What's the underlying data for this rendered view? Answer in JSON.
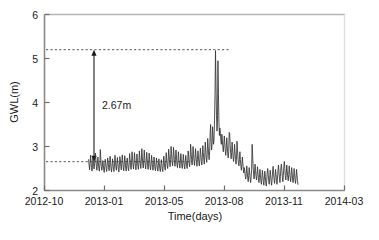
{
  "chart_data": {
    "type": "line",
    "title": "",
    "xlabel": "Time(days)",
    "ylabel": "GWL(m)",
    "ylim": [
      2,
      6
    ],
    "yticks": [
      2,
      3,
      4,
      5,
      6
    ],
    "ytick_labels": [
      "2",
      "3",
      "4",
      "5",
      "6"
    ],
    "xtick_labels": [
      "2012-10",
      "2013-01",
      "2013-05",
      "2013-08",
      "2013-11",
      "2014-03"
    ],
    "xtick_positions": [
      0,
      0.2,
      0.4,
      0.6,
      0.8,
      1.0
    ],
    "grid": false,
    "legend": "none",
    "line_color": "#333333",
    "series": [
      {
        "name": "GWL",
        "x_start_frac": 0.147,
        "x_end_frac": 0.845,
        "values": [
          2.7,
          2.58,
          2.47,
          2.62,
          2.8,
          2.66,
          2.52,
          2.44,
          2.57,
          2.74,
          2.62,
          2.49,
          2.55,
          2.71,
          2.85,
          2.7,
          2.54,
          2.46,
          2.6,
          2.76,
          2.63,
          2.5,
          2.44,
          2.58,
          2.93,
          2.72,
          2.55,
          2.46,
          2.52,
          2.68,
          2.6,
          2.47,
          2.41,
          2.55,
          2.71,
          2.63,
          2.5,
          2.43,
          2.57,
          2.74,
          2.66,
          2.52,
          2.45,
          2.59,
          2.78,
          2.64,
          2.49,
          2.42,
          2.55,
          2.72,
          2.61,
          2.48,
          2.43,
          2.58,
          2.8,
          2.67,
          2.53,
          2.46,
          2.6,
          2.75,
          2.62,
          2.48,
          2.42,
          2.56,
          2.77,
          2.7,
          2.55,
          2.47,
          2.62,
          2.81,
          2.68,
          2.53,
          2.45,
          2.59,
          2.79,
          2.66,
          2.51,
          2.44,
          2.57,
          2.74,
          2.63,
          2.5,
          2.45,
          2.6,
          2.84,
          2.71,
          2.56,
          2.48,
          2.63,
          2.88,
          2.73,
          2.57,
          2.49,
          2.64,
          2.86,
          2.7,
          2.54,
          2.47,
          2.61,
          2.83,
          2.69,
          2.55,
          2.48,
          2.63,
          2.9,
          2.75,
          2.58,
          2.5,
          2.66,
          2.95,
          2.78,
          2.6,
          2.51,
          2.67,
          2.92,
          2.74,
          2.57,
          2.49,
          2.64,
          2.87,
          2.72,
          2.56,
          2.48,
          2.62,
          2.85,
          2.7,
          2.54,
          2.47,
          2.6,
          2.8,
          2.66,
          2.52,
          2.46,
          2.59,
          2.76,
          2.64,
          2.5,
          2.45,
          2.58,
          2.74,
          2.62,
          2.49,
          2.44,
          2.57,
          2.72,
          2.61,
          2.48,
          2.43,
          2.56,
          2.7,
          2.6,
          2.47,
          2.43,
          2.58,
          2.78,
          2.66,
          2.52,
          2.46,
          2.62,
          2.86,
          2.72,
          2.57,
          2.5,
          2.66,
          2.94,
          2.8,
          2.63,
          2.54,
          2.7,
          3.0,
          2.84,
          2.66,
          2.56,
          2.72,
          2.98,
          2.82,
          2.64,
          2.55,
          2.7,
          2.92,
          2.76,
          2.6,
          2.52,
          2.67,
          2.88,
          2.73,
          2.58,
          2.51,
          2.65,
          2.84,
          2.7,
          2.56,
          2.5,
          2.64,
          2.82,
          2.69,
          2.55,
          2.49,
          2.63,
          2.8,
          2.68,
          2.55,
          2.5,
          2.66,
          2.9,
          2.78,
          2.62,
          2.54,
          2.72,
          3.05,
          2.88,
          2.7,
          2.58,
          2.74,
          3.0,
          2.84,
          2.67,
          2.57,
          2.72,
          2.95,
          2.8,
          2.64,
          2.55,
          2.7,
          2.9,
          2.76,
          2.62,
          2.56,
          2.72,
          2.96,
          2.82,
          2.66,
          2.58,
          2.75,
          3.02,
          2.86,
          2.7,
          2.6,
          2.78,
          3.1,
          2.92,
          2.74,
          2.64,
          2.82,
          3.18,
          3.0,
          2.8,
          2.7,
          2.88,
          3.3,
          3.5,
          3.1,
          2.92,
          3.05,
          3.45,
          3.25,
          3.05,
          3.15,
          3.6,
          4.2,
          5.18,
          4.4,
          3.7,
          3.35,
          3.55,
          4.95,
          4.2,
          3.55,
          3.25,
          3.42,
          3.3,
          3.12,
          3.05,
          3.28,
          3.15,
          2.98,
          2.88,
          3.05,
          3.24,
          3.08,
          2.9,
          2.8,
          2.95,
          3.2,
          3.02,
          2.84,
          2.74,
          2.88,
          3.32,
          3.3,
          3.05,
          2.85,
          2.72,
          2.86,
          3.1,
          2.92,
          2.76,
          2.66,
          2.8,
          3.05,
          2.88,
          2.7,
          2.6,
          2.74,
          3.12,
          2.94,
          2.74,
          2.62,
          2.56,
          2.7,
          2.88,
          2.7,
          2.55,
          2.46,
          2.58,
          2.76,
          2.62,
          2.48,
          2.4,
          2.52,
          2.44,
          2.32,
          2.26,
          2.38,
          2.56,
          2.42,
          2.28,
          2.2,
          2.34,
          2.52,
          2.4,
          2.26,
          2.18,
          2.3,
          2.48,
          3.05,
          2.8,
          2.55,
          2.38,
          2.26,
          2.42,
          2.6,
          2.46,
          2.32,
          2.24,
          2.36,
          2.54,
          2.4,
          2.26,
          2.18,
          2.3,
          2.48,
          2.35,
          2.22,
          2.14,
          2.28,
          2.46,
          2.34,
          2.2,
          2.12,
          2.26,
          2.44,
          2.32,
          2.18,
          2.1,
          2.24,
          2.42,
          2.5,
          2.36,
          2.22,
          2.14,
          2.28,
          2.46,
          2.34,
          2.2,
          2.12,
          2.26,
          2.44,
          2.55,
          2.4,
          2.25,
          2.16,
          2.3,
          2.48,
          2.36,
          2.22,
          2.14,
          2.28,
          2.46,
          2.58,
          2.44,
          2.28,
          2.18,
          2.32,
          2.52,
          2.6,
          2.46,
          2.3,
          2.2,
          2.34,
          2.54,
          2.66,
          2.5,
          2.34,
          2.24,
          2.38,
          2.58,
          2.44,
          2.3,
          2.22,
          2.36,
          2.56,
          2.42,
          2.28,
          2.2,
          2.34,
          2.52,
          2.4,
          2.26,
          2.18,
          2.3,
          2.5,
          2.38,
          2.24,
          2.16,
          2.3,
          2.48,
          2.35,
          2.22,
          2.14
        ]
      }
    ],
    "annotations": [
      {
        "name": "gwl-drop-annotation",
        "label": "2.67m",
        "upper_value": 5.2,
        "lower_value": 2.655,
        "arrow_x_frac": 0.165,
        "upper_line_x_end_frac": 0.6165,
        "lower_line_x_end_frac": 0.492
      }
    ]
  },
  "axis": {
    "y_title": "GWL(m)",
    "x_title": "Time(days)",
    "y_ticks": [
      "6",
      "5",
      "4",
      "3",
      "2"
    ],
    "x_ticks": [
      "2012-10",
      "2013-01",
      "2013-05",
      "2013-08",
      "2013-11",
      "2014-03"
    ]
  },
  "annotation": {
    "drop_label": "2.67m"
  },
  "caption": {
    "text": ""
  },
  "colors": {
    "line": "#333333",
    "axis": "#8a8a8a",
    "dashed": "#555555",
    "text": "#1a1a1a"
  }
}
